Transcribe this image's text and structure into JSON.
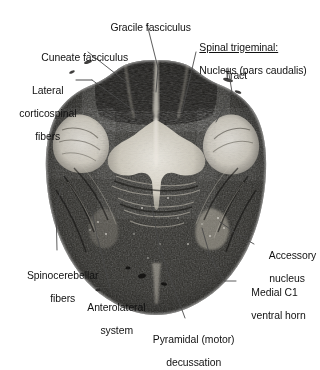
{
  "figure": {
    "type": "anatomical-cross-section",
    "stain": "myelin-stained transverse histological section",
    "background_color": "#ffffff",
    "tissue_dark_color": "#2b2b2b",
    "tissue_light_color": "#e4e0d8",
    "leader_line_color": "#4a4a4a"
  },
  "labels": [
    {
      "id": "gracile-fasciculus",
      "lines": [
        "Gracile fasciculus"
      ],
      "align": "center",
      "underline_first_line": false
    },
    {
      "id": "cuneate-fasciculus",
      "lines": [
        "Cuneate fasciculus"
      ],
      "align": "center",
      "underline_first_line": false
    },
    {
      "id": "spinal-trigeminal",
      "lines": [
        "Spinal trigeminal:",
        "Nucleus (pars caudalis)"
      ],
      "align": "left",
      "underline_first_line": true
    },
    {
      "id": "tract",
      "lines": [
        "Tract"
      ],
      "align": "center",
      "underline_first_line": false
    },
    {
      "id": "lateral-corticospinal-fibers",
      "lines": [
        "Lateral",
        "corticospinal",
        "fibers"
      ],
      "align": "center",
      "underline_first_line": false
    },
    {
      "id": "spinocerebellar-fibers",
      "lines": [
        "Spinocerebellar",
        "fibers"
      ],
      "align": "center",
      "underline_first_line": false
    },
    {
      "id": "anterolateral-system",
      "lines": [
        "Anterolateral",
        "system"
      ],
      "align": "center",
      "underline_first_line": false
    },
    {
      "id": "pyramidal-decussation",
      "lines": [
        "Pyramidal (motor)",
        "decussation"
      ],
      "align": "center",
      "underline_first_line": false
    },
    {
      "id": "accessory-nucleus",
      "lines": [
        "Accessory",
        "nucleus"
      ],
      "align": "left",
      "underline_first_line": false
    },
    {
      "id": "medial-c1-ventral-horn",
      "lines": [
        "Medial C1",
        "ventral horn"
      ],
      "align": "left",
      "underline_first_line": false
    }
  ]
}
